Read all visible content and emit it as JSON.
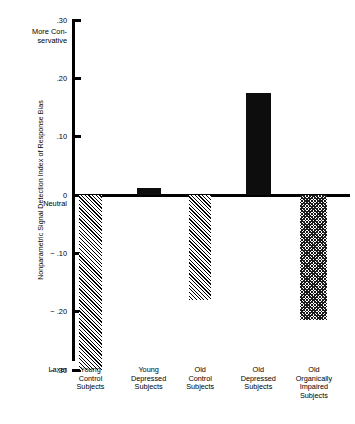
{
  "chart_data": {
    "type": "bar",
    "title": "",
    "subtitle": "",
    "xlabel": "",
    "ylabel": "Nonparametric Signal Detection Index of Response Bias",
    "categories": [
      "Young Control Subjects",
      "Young Depressed Subjects",
      "Old Control Subjects",
      "Old Depressed Subjects",
      "Old Organically Impaired Subjects"
    ],
    "values": [
      -0.3,
      0.012,
      -0.18,
      0.175,
      -0.215
    ],
    "ylim": [
      -0.3,
      0.3
    ],
    "yticks": [
      0.3,
      0.2,
      0.1,
      0,
      -0.1,
      -0.2,
      -0.3
    ],
    "ytick_labels": [
      ".30",
      ".20",
      ".10",
      "0",
      "− .10",
      "− .20",
      "− .30"
    ],
    "grid": false,
    "legend": "none",
    "bar_fills": [
      "hatch",
      "solid",
      "hatch",
      "solid",
      "checker"
    ],
    "annotations": {
      "top": "More Con-\nservative",
      "top_line1": "More Con-",
      "top_line2": "servative",
      "zero": "Neutral",
      "bottom": "Laxer"
    }
  },
  "axis": {
    "ticks": [
      {
        "label": ".30"
      },
      {
        "label": ".20"
      },
      {
        "label": ".10"
      },
      {
        "label": "0"
      },
      {
        "label": "− .10"
      },
      {
        "label": "− .20"
      },
      {
        "label": "− .30"
      }
    ]
  },
  "xlabels": [
    {
      "line1": "Young",
      "line2": "Control",
      "line3": "Subjects",
      "line4": ""
    },
    {
      "line1": "Young",
      "line2": "Depressed",
      "line3": "Subjects",
      "line4": ""
    },
    {
      "line1": "Old",
      "line2": "Control",
      "line3": "Subjects",
      "line4": ""
    },
    {
      "line1": "Old",
      "line2": "Depressed",
      "line3": "Subjects",
      "line4": ""
    },
    {
      "line1": "Old",
      "line2": "Organically",
      "line3": "Impaired",
      "line4": "Subjects"
    }
  ],
  "colors": {
    "ink": "#000000",
    "bar_solid": "#0d0d0d",
    "background": "#ffffff"
  }
}
